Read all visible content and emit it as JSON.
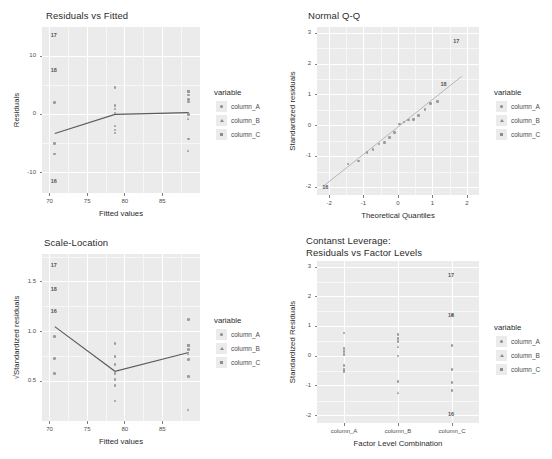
{
  "figure": {
    "width": 552,
    "height": 459,
    "background": "#ffffff",
    "panel_fill": "#ebebeb",
    "gridline_color": "#ffffff",
    "point_color": "#9a9a9a",
    "line_color": "#666666"
  },
  "legend": {
    "title": "variable",
    "items": [
      {
        "label": "column_A",
        "shape": "circle"
      },
      {
        "label": "column_B",
        "shape": "triangle"
      },
      {
        "label": "column_C",
        "shape": "square"
      }
    ]
  },
  "chart_data": [
    {
      "id": "residuals-vs-fitted",
      "type": "scatter",
      "title": "Residuals vs Fitted",
      "xlabel": "Fitted values",
      "ylabel": "Residuals",
      "xlim": [
        69.0,
        90.0
      ],
      "ylim": [
        -13.5,
        15.0
      ],
      "xticks": [
        70,
        75,
        80,
        85
      ],
      "yticks": [
        -10,
        0,
        10
      ],
      "xtick_labels": [
        "70",
        "75",
        "80",
        "85"
      ],
      "ytick_labels": [
        "-10",
        "0",
        "10"
      ],
      "grid": true,
      "legend_position": "right",
      "series": [
        {
          "name": "column_A",
          "shape": "circle",
          "points": [
            {
              "x": 70.7,
              "y": 2.0
            },
            {
              "x": 70.7,
              "y": -5.0
            },
            {
              "x": 70.7,
              "y": -6.8
            },
            {
              "x": 78.7,
              "y": 4.6
            },
            {
              "x": 78.7,
              "y": 1.5
            },
            {
              "x": 78.7,
              "y": 0.9
            },
            {
              "x": 78.7,
              "y": 0.2
            },
            {
              "x": 78.7,
              "y": -2.0
            },
            {
              "x": 78.7,
              "y": -2.7
            },
            {
              "x": 78.7,
              "y": -3.2
            },
            {
              "x": 88.5,
              "y": 3.3
            },
            {
              "x": 88.5,
              "y": 2.6
            },
            {
              "x": 88.5,
              "y": 2.1
            },
            {
              "x": 88.5,
              "y": 0.0
            },
            {
              "x": 88.5,
              "y": -4.2
            }
          ]
        },
        {
          "name": "column_B",
          "shape": "triangle",
          "points": [
            {
              "x": 88.5,
              "y": -0.6
            },
            {
              "x": 88.5,
              "y": -6.2
            }
          ]
        },
        {
          "name": "column_C",
          "shape": "square",
          "points": [
            {
              "x": 88.5,
              "y": 3.9
            }
          ]
        }
      ],
      "trend_line": [
        {
          "x": 70.7,
          "y": -3.3
        },
        {
          "x": 78.7,
          "y": 0.0
        },
        {
          "x": 88.5,
          "y": 0.3
        }
      ],
      "point_labels": [
        {
          "text": "17",
          "x": 70.7,
          "y": 13.6
        },
        {
          "text": "18",
          "x": 70.7,
          "y": 7.6
        },
        {
          "text": "16",
          "x": 70.7,
          "y": -11.6
        }
      ]
    },
    {
      "id": "normal-qq",
      "type": "scatter",
      "title": "Normal Q-Q",
      "xlabel": "Theoretical Quantiles",
      "ylabel": "Standardized residuals",
      "xlim": [
        -2.35,
        2.35
      ],
      "ylim": [
        -2.25,
        3.2
      ],
      "xticks": [
        -2,
        -1,
        0,
        1,
        2
      ],
      "yticks": [
        -2,
        -1,
        0,
        1,
        2,
        3
      ],
      "xtick_labels": [
        "-2",
        "-1",
        "0",
        "1",
        "2"
      ],
      "ytick_labels": [
        "-2",
        "-1",
        "0",
        "1",
        "2",
        "3"
      ],
      "grid": true,
      "legend_position": "right",
      "reference_line": [
        {
          "x": -2.15,
          "y": -1.95
        },
        {
          "x": 1.85,
          "y": 1.6
        }
      ],
      "series": [
        {
          "name": "column_A",
          "shape": "circle",
          "points": [
            {
              "x": -1.45,
              "y": -1.25
            },
            {
              "x": -1.15,
              "y": -1.15
            },
            {
              "x": -0.9,
              "y": -0.88
            },
            {
              "x": -0.72,
              "y": -0.78
            },
            {
              "x": -0.55,
              "y": -0.6
            },
            {
              "x": -0.4,
              "y": -0.55
            },
            {
              "x": -0.25,
              "y": -0.38
            },
            {
              "x": -0.1,
              "y": -0.22
            },
            {
              "x": 0.05,
              "y": 0.05
            },
            {
              "x": 0.18,
              "y": 0.12
            },
            {
              "x": 0.3,
              "y": 0.18
            },
            {
              "x": 0.45,
              "y": 0.2
            },
            {
              "x": 0.6,
              "y": 0.32
            },
            {
              "x": 0.78,
              "y": 0.52
            },
            {
              "x": 0.95,
              "y": 0.72
            },
            {
              "x": 1.15,
              "y": 0.78
            }
          ]
        },
        {
          "name": "column_B",
          "shape": "triangle",
          "points": []
        },
        {
          "name": "column_C",
          "shape": "square",
          "points": []
        }
      ],
      "point_labels": [
        {
          "text": "17",
          "x": 1.72,
          "y": 2.72
        },
        {
          "text": "18",
          "x": 1.35,
          "y": 1.35
        },
        {
          "text": "16",
          "x": -2.08,
          "y": -2.0
        }
      ]
    },
    {
      "id": "scale-location",
      "type": "scatter",
      "title": "Scale-Location",
      "xlabel": "Fitted values",
      "ylabel": "√Standardized residuals",
      "xlim": [
        69.0,
        90.0
      ],
      "ylim": [
        0.1,
        1.78
      ],
      "xticks": [
        70,
        75,
        80,
        85
      ],
      "yticks": [
        0.5,
        1.0,
        1.5
      ],
      "xtick_labels": [
        "70",
        "75",
        "80",
        "85"
      ],
      "ytick_labels": [
        "0.5",
        "1.0",
        "1.5"
      ],
      "grid": true,
      "legend_position": "right",
      "series": [
        {
          "name": "column_A",
          "shape": "circle",
          "points": [
            {
              "x": 70.7,
              "y": 0.95
            },
            {
              "x": 70.7,
              "y": 0.73
            },
            {
              "x": 70.7,
              "y": 0.58
            },
            {
              "x": 78.7,
              "y": 0.88
            },
            {
              "x": 78.7,
              "y": 0.75
            },
            {
              "x": 78.7,
              "y": 0.67
            },
            {
              "x": 78.7,
              "y": 0.58
            },
            {
              "x": 78.7,
              "y": 0.52
            },
            {
              "x": 78.7,
              "y": 0.46
            },
            {
              "x": 78.7,
              "y": 0.3
            },
            {
              "x": 88.5,
              "y": 1.12
            },
            {
              "x": 88.5,
              "y": 0.82
            },
            {
              "x": 88.5,
              "y": 0.72
            },
            {
              "x": 88.5,
              "y": 0.55
            }
          ]
        },
        {
          "name": "column_B",
          "shape": "triangle",
          "points": [
            {
              "x": 88.5,
              "y": 0.78
            },
            {
              "x": 88.5,
              "y": 0.22
            }
          ]
        },
        {
          "name": "column_C",
          "shape": "square",
          "points": [
            {
              "x": 88.5,
              "y": 0.86
            }
          ]
        }
      ],
      "trend_line": [
        {
          "x": 70.7,
          "y": 1.05
        },
        {
          "x": 78.7,
          "y": 0.6
        },
        {
          "x": 88.5,
          "y": 0.79
        }
      ],
      "point_labels": [
        {
          "text": "17",
          "x": 70.7,
          "y": 1.66
        },
        {
          "text": "18",
          "x": 70.7,
          "y": 1.42
        },
        {
          "text": "16",
          "x": 70.7,
          "y": 1.2
        }
      ]
    },
    {
      "id": "constant-leverage",
      "type": "scatter",
      "title": "Contanst Leverage:\nResiduals vs Factor Levels",
      "xlabel": "Factor Level Combination",
      "ylabel": "Standardized Residuals",
      "categories": [
        "column_A",
        "column_B",
        "column_C"
      ],
      "ylim": [
        -2.25,
        3.2
      ],
      "yticks": [
        -2,
        -1,
        0,
        1,
        2,
        3
      ],
      "ytick_labels": [
        "-2",
        "-1",
        "0",
        "1",
        "2",
        "3"
      ],
      "grid": true,
      "legend_position": "right",
      "series": [
        {
          "name": "column_A",
          "shape": "circle",
          "category": "column_A",
          "points": [
            {
              "cat": 0,
              "y": 0.78
            },
            {
              "cat": 0,
              "y": 0.25
            },
            {
              "cat": 0,
              "y": 0.15
            },
            {
              "cat": 0,
              "y": 0.05
            },
            {
              "cat": 0,
              "y": -0.32
            },
            {
              "cat": 0,
              "y": -0.45
            },
            {
              "cat": 0,
              "y": -0.52
            },
            {
              "cat": 1,
              "y": 0.72
            },
            {
              "cat": 1,
              "y": 0.6
            },
            {
              "cat": 1,
              "y": 0.5
            },
            {
              "cat": 1,
              "y": 0.0
            },
            {
              "cat": 1,
              "y": -0.85
            },
            {
              "cat": 2,
              "y": 0.35
            },
            {
              "cat": 2,
              "y": -0.45
            },
            {
              "cat": 2,
              "y": -0.88
            },
            {
              "cat": 2,
              "y": -1.15
            }
          ]
        },
        {
          "name": "column_B",
          "shape": "triangle",
          "points": [
            {
              "cat": 1,
              "y": 0.32
            },
            {
              "cat": 1,
              "y": -1.22
            }
          ]
        },
        {
          "name": "column_C",
          "shape": "square",
          "points": [
            {
              "cat": 2,
              "y": 1.38
            }
          ]
        }
      ],
      "point_labels": [
        {
          "text": "17",
          "cat": 2,
          "y": 2.72
        },
        {
          "text": "18",
          "cat": 2,
          "y": 1.38
        },
        {
          "text": "16",
          "cat": 2,
          "y": -1.95
        }
      ]
    }
  ]
}
